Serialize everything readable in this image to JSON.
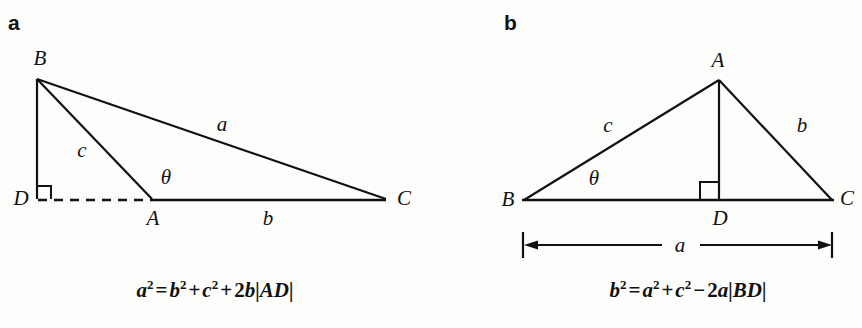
{
  "figure": {
    "background_color": "#fdfdfc",
    "ink_color": "#111111",
    "panels": [
      {
        "id": "a",
        "label": "a",
        "caption": "a² = b² + c² + 2b|AD|",
        "caption_parts": {
          "lhs_base": "a",
          "lhs_exp": "2",
          "eq": "=",
          "t1_base": "b",
          "t1_exp": "2",
          "op1": "+",
          "t2_base": "c",
          "t2_exp": "2",
          "op2": "+",
          "t3_coef": "2",
          "t3_var": "b",
          "t3_abs": "|AD|"
        },
        "vertices": [
          {
            "name": "B",
            "label": "B"
          },
          {
            "name": "D",
            "label": "D"
          },
          {
            "name": "A",
            "label": "A"
          },
          {
            "name": "C",
            "label": "C"
          }
        ],
        "side_labels": [
          {
            "name": "side-a",
            "label": "a"
          },
          {
            "name": "side-b",
            "label": "b"
          },
          {
            "name": "side-c",
            "label": "c"
          }
        ],
        "angle_label": "θ",
        "right_angle_at": "D",
        "dashed_segment": "DA"
      },
      {
        "id": "b",
        "label": "b",
        "caption": "b² = a² + c² − 2a|BD|",
        "caption_parts": {
          "lhs_base": "b",
          "lhs_exp": "2",
          "eq": "=",
          "t1_base": "a",
          "t1_exp": "2",
          "op1": "+",
          "t2_base": "c",
          "t2_exp": "2",
          "op2": "−",
          "t3_coef": "2",
          "t3_var": "a",
          "t3_abs": "|BD|"
        },
        "vertices": [
          {
            "name": "A",
            "label": "A"
          },
          {
            "name": "B",
            "label": "B"
          },
          {
            "name": "D",
            "label": "D"
          },
          {
            "name": "C",
            "label": "C"
          }
        ],
        "side_labels": [
          {
            "name": "side-b",
            "label": "b"
          },
          {
            "name": "side-c",
            "label": "c"
          }
        ],
        "angle_label": "θ",
        "right_angle_at": "D",
        "dimension_label": "a"
      }
    ]
  }
}
